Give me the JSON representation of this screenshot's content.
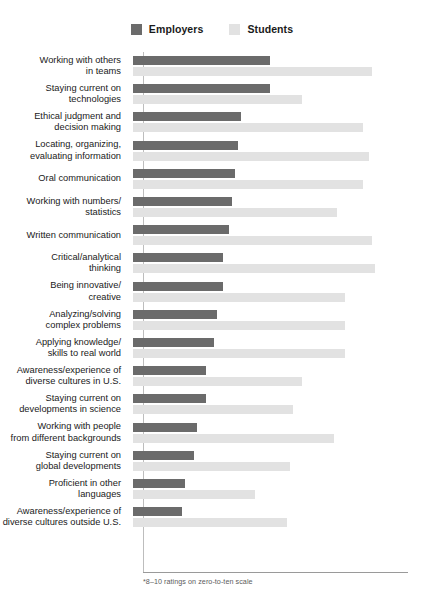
{
  "legend": {
    "entries": [
      {
        "label": "Employers",
        "color": "#6b6b6b",
        "swatch_name": "legend-swatch-employers"
      },
      {
        "label": "Students",
        "color": "#e2e2e2",
        "swatch_name": "legend-swatch-students"
      }
    ]
  },
  "footnote": "*8–10 ratings on zero-to-ten scale",
  "chart_data": {
    "type": "bar",
    "orientation": "horizontal",
    "title": "",
    "subtitle": "",
    "xlabel": "",
    "ylabel": "",
    "xlim": [
      0,
      100
    ],
    "grid": false,
    "legend_position": "top-center",
    "note": "*8–10 ratings on zero-to-ten scale",
    "categories": [
      "Working with others\nin teams",
      "Staying current on\ntechnologies",
      "Ethical judgment and\ndecision making",
      "Locating, organizing,\nevaluating information",
      "Oral communication",
      "Working with numbers/\nstatistics",
      "Written communication",
      "Critical/analytical\nthinking",
      "Being innovative/\ncreative",
      "Analyzing/solving\ncomplex problems",
      "Applying knowledge/\nskills to real world",
      "Awareness/experience of\ndiverse cultures in U.S.",
      "Staying current on\ndevelopments in science",
      "Working with people\nfrom different backgrounds",
      "Staying current on\nglobal developments",
      "Proficient in other\nlanguages",
      "Awareness/experience of\ndiverse cultures outside U.S."
    ],
    "series": [
      {
        "name": "Employers",
        "color": "#6b6b6b",
        "values": [
          47,
          47,
          37,
          36,
          35,
          34,
          33,
          31,
          31,
          29,
          28,
          25,
          25,
          22,
          21,
          18,
          17
        ]
      },
      {
        "name": "Students",
        "color": "#e2e2e2",
        "values": [
          82,
          58,
          79,
          81,
          79,
          70,
          82,
          83,
          73,
          73,
          73,
          58,
          55,
          69,
          54,
          42,
          53
        ]
      }
    ]
  }
}
